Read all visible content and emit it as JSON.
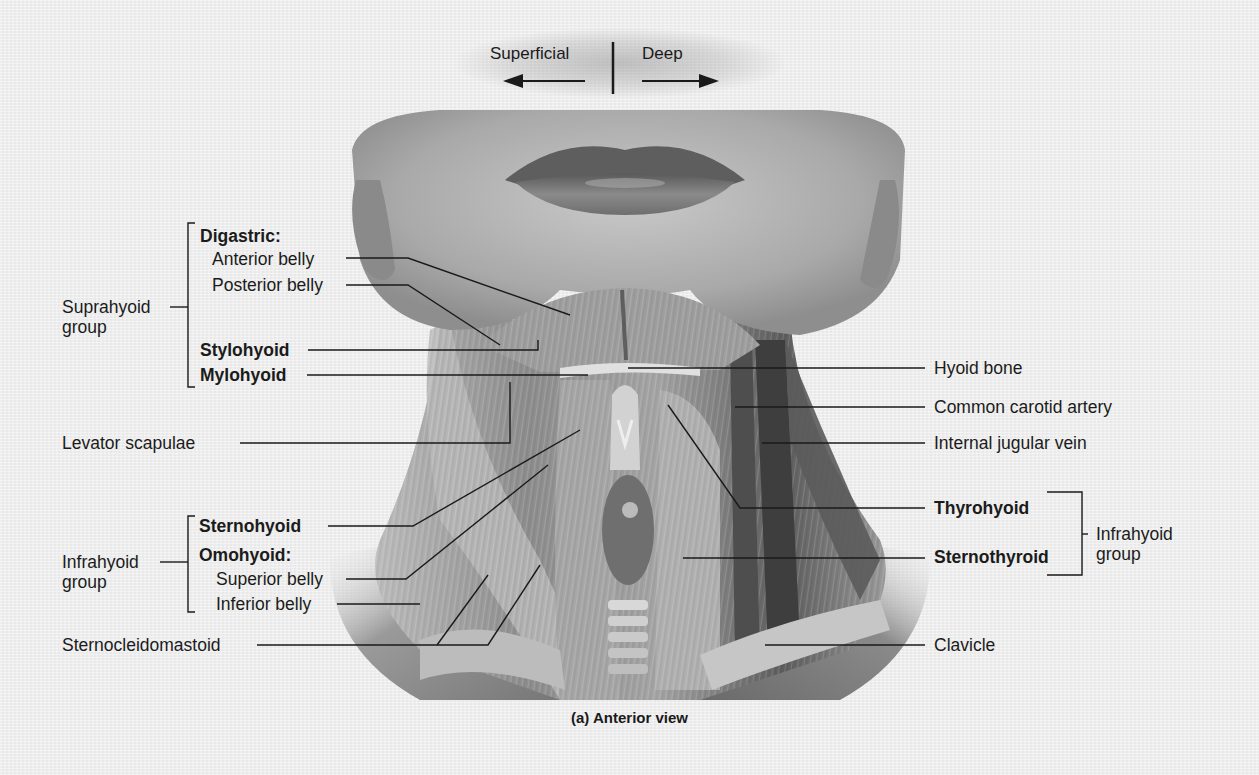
{
  "figure": {
    "caption": "(a) Anterior view",
    "style": "grayscale anatomical illustration",
    "background_color": "#efefef",
    "orientation": {
      "left_label": "Superficial",
      "right_label": "Deep",
      "left_arrow": "arrow-left",
      "right_arrow": "arrow-right"
    }
  },
  "groups": {
    "suprahyoid": {
      "label_line1": "Suprahyoid",
      "label_line2": "group"
    },
    "infrahyoid_left": {
      "label_line1": "Infrahyoid",
      "label_line2": "group"
    },
    "infrahyoid_right": {
      "label_line1": "Infrahyoid",
      "label_line2": "group"
    }
  },
  "labels": {
    "left": {
      "digastric": "Digastric:",
      "anterior_belly": "Anterior belly",
      "posterior_belly": "Posterior belly",
      "stylohyoid": "Stylohyoid",
      "mylohyoid": "Mylohyoid",
      "levator_scapulae": "Levator scapulae",
      "sternohyoid": "Sternohyoid",
      "omohyoid": "Omohyoid:",
      "superior_belly": "Superior belly",
      "inferior_belly": "Inferior belly",
      "sternocleidomastoid": "Sternocleidomastoid"
    },
    "right": {
      "hyoid_bone": "Hyoid bone",
      "common_carotid_artery": "Common carotid artery",
      "internal_jugular_vein": "Internal jugular vein",
      "thyrohyoid": "Thyrohyoid",
      "sternothyroid": "Sternothyroid",
      "clavicle": "Clavicle"
    }
  }
}
